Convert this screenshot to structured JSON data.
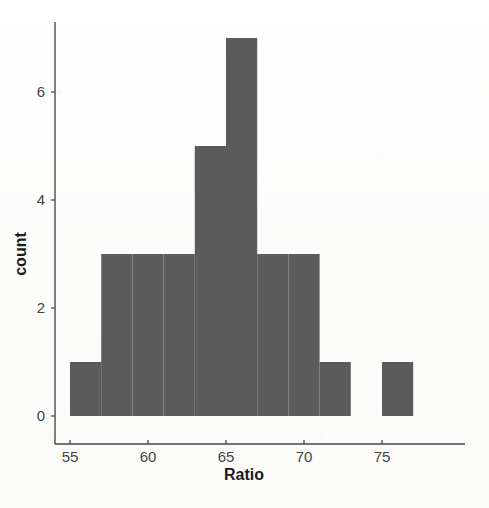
{
  "chart_data": {
    "type": "bar",
    "subtype": "histogram",
    "title": "",
    "xlabel": "Ratio",
    "ylabel": "count",
    "xlim": [
      54.0,
      78.0
    ],
    "ylim": [
      0,
      7.4
    ],
    "grid": false,
    "legend": null,
    "bin_width": 2,
    "bar_color": "#5b5b5b",
    "axis_color": "#4a4a4a",
    "background_color": "#fdfdfd",
    "xticks": [
      55,
      60,
      65,
      70,
      75
    ],
    "xtick_labels": [
      "55",
      "60",
      "65",
      "70",
      "75"
    ],
    "yticks": [
      0,
      2,
      4,
      6
    ],
    "ytick_labels": [
      "0",
      "2",
      "4",
      "6"
    ],
    "bins": [
      {
        "left": 55,
        "right": 57,
        "count": 1
      },
      {
        "left": 57,
        "right": 59,
        "count": 3
      },
      {
        "left": 59,
        "right": 61,
        "count": 3
      },
      {
        "left": 61,
        "right": 63,
        "count": 3
      },
      {
        "left": 63,
        "right": 65,
        "count": 5
      },
      {
        "left": 65,
        "right": 67,
        "count": 7
      },
      {
        "left": 67,
        "right": 69,
        "count": 3
      },
      {
        "left": 69,
        "right": 71,
        "count": 3
      },
      {
        "left": 71,
        "right": 73,
        "count": 1
      },
      {
        "left": 73,
        "right": 75,
        "count": 0
      },
      {
        "left": 75,
        "right": 77,
        "count": 1
      }
    ],
    "categories": [
      "55-57",
      "57-59",
      "59-61",
      "61-63",
      "63-65",
      "65-67",
      "67-69",
      "69-71",
      "71-73",
      "73-75",
      "75-77"
    ],
    "values": [
      1,
      3,
      3,
      3,
      5,
      7,
      3,
      3,
      1,
      0,
      1
    ],
    "total_count": 30
  }
}
